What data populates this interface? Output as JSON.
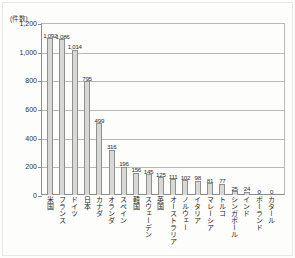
{
  "chart_data": {
    "type": "bar",
    "title": "",
    "subtitle": "",
    "xlabel": "",
    "ylabel": "",
    "unit_caption": "(件数)",
    "ylim": [
      0,
      1200
    ],
    "yticks": [
      0,
      200,
      400,
      600,
      800,
      1000,
      1200
    ],
    "ytick_labels": [
      "0",
      "200",
      "400",
      "600",
      "800",
      "1,000",
      "1,200"
    ],
    "grid": true,
    "legend": "none",
    "categories": [
      "米国",
      "フランス",
      "ドイツ",
      "日本",
      "カナダ",
      "オランダ",
      "スペイン",
      "韓国",
      "スウェーデン",
      "英国",
      "オーストラリア",
      "ノルウェー",
      "イタリア",
      "マレーシア",
      "トルコ",
      "シンガポール",
      "インド",
      "ポーランド",
      "カタール"
    ],
    "values": [
      1092,
      1086,
      1014,
      795,
      499,
      316,
      196,
      156,
      145,
      125,
      111,
      102,
      98,
      81,
      77,
      25,
      24,
      0,
      0
    ],
    "value_labels": [
      "1,092",
      "1,086",
      "1,014",
      "795",
      "499",
      "316",
      "196",
      "156",
      "145",
      "125",
      "111",
      "102",
      "98",
      "81",
      "77",
      "25",
      "24",
      "0",
      "0"
    ]
  },
  "style": {
    "bar_fill": "#d8d8d6",
    "bar_stroke": "#8f8f8d",
    "axis_color": "#8c8c8c",
    "grid_color": "#b9b9b9",
    "text_color": "#2c2c2c",
    "background": "#ffffff"
  }
}
